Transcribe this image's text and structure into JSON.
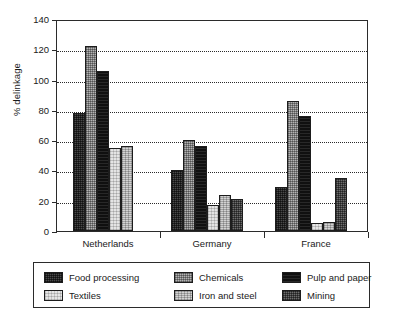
{
  "chart_data": {
    "type": "bar",
    "title": "",
    "xlabel": "",
    "ylabel": "% delinkage",
    "ylim": [
      0,
      140
    ],
    "ytick_step": 20,
    "yticks": [
      0,
      20,
      40,
      60,
      80,
      100,
      120,
      140
    ],
    "grid": "horizontal-dotted",
    "legend_position": "bottom",
    "categories": [
      "Netherlands",
      "Germany",
      "France"
    ],
    "series": [
      {
        "name": "Food processing",
        "values": [
          78,
          40,
          29
        ],
        "fill": "f-food",
        "color": "#4a4a4a"
      },
      {
        "name": "Chemicals",
        "values": [
          122,
          60,
          86
        ],
        "fill": "f-chem",
        "color": "#b4b4b4"
      },
      {
        "name": "Pulp and paper",
        "values": [
          106,
          56,
          76
        ],
        "fill": "f-pulp",
        "color": "#101010"
      },
      {
        "name": "Textiles",
        "values": [
          55,
          17,
          5
        ],
        "fill": "f-text",
        "color": "#e4e4e4"
      },
      {
        "name": "Iron and steel",
        "values": [
          56,
          24,
          6
        ],
        "fill": "f-iron",
        "color": "#d2d2d2"
      },
      {
        "name": "Mining",
        "values": [
          0,
          21,
          35
        ],
        "fill": "f-mining",
        "color": "#6e6e6e"
      }
    ]
  },
  "legend": {
    "entries": [
      {
        "label": "Food processing",
        "fill": "f-food"
      },
      {
        "label": "Chemicals",
        "fill": "f-chem"
      },
      {
        "label": "Pulp and paper",
        "fill": "f-pulp"
      },
      {
        "label": "Textiles",
        "fill": "f-text"
      },
      {
        "label": "Iron and steel",
        "fill": "f-iron"
      },
      {
        "label": "Mining",
        "fill": "f-mining"
      }
    ]
  }
}
